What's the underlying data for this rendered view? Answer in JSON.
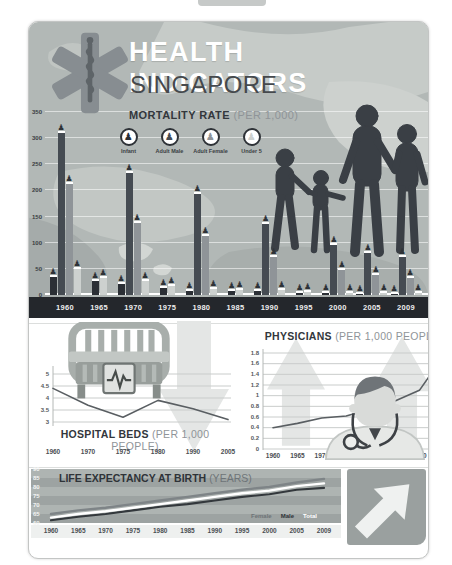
{
  "header": {
    "title": "HEALTH INDICATORS",
    "subtitle": "SINGAPORE"
  },
  "icons": {
    "person": "♟",
    "star_of_life_icon": "six-armed medical star with rod of asclepius",
    "hospital_bed_icon": "hospital bed with ecg panel",
    "doctor_icon": "doctor with stethoscope",
    "family_silhouette": "family of four holding hands",
    "down_arrow_icon": "large down arrow",
    "up_arrow_icon": "large up arrow",
    "up_right_arrow_icon": "large diagonal up-right arrow"
  },
  "colors": {
    "header_bg": "#b2b8b6",
    "card_border": "#c3c5c4",
    "title_text": "#ffffff",
    "subtitle_text": "#45494d",
    "heading_dark": "#33373c",
    "heading_muted": "#8f9498",
    "axis_text": "#3a3e43",
    "year_band_bg": "#24272c",
    "year_band_text": "#ededee",
    "grid_light": "#cdd1cf",
    "line_stroke": "#595e62",
    "arrow_gray": "#e4e6e5",
    "silhouette": "#3a3f45",
    "stripe_light": "#aeb4b2",
    "stripe_dark": "#9da3a2",
    "label_strip_bg": "#eef0ef",
    "bottom_box_bg": "#9aa09f",
    "bottom_arrow": "#eff1f0",
    "bar_infant": "#2b2f35",
    "bar_adult_male": "#454b52",
    "bar_adult_female": "#8f9498",
    "bar_under5": "#cdd1cf"
  },
  "chart_data": [
    {
      "id": "mortality",
      "type": "bar",
      "title": "MORTALITY RATE",
      "title_suffix": "(PER 1,000)",
      "legend": [
        "Infant",
        "Adult Male",
        "Adult Female",
        "Under 5"
      ],
      "categories": [
        "1960",
        "1965",
        "1970",
        "1975",
        "1980",
        "1985",
        "1990",
        "1995",
        "2000",
        "2005",
        "2009"
      ],
      "series": [
        {
          "name": "Infant",
          "color": "#2b2f35",
          "values": [
            35,
            26,
            21,
            14,
            8,
            7,
            7,
            4,
            3,
            2,
            2
          ]
        },
        {
          "name": "Adult Male",
          "color": "#454b52",
          "values": [
            310,
            null,
            233,
            null,
            193,
            null,
            135,
            null,
            95,
            80,
            73
          ]
        },
        {
          "name": "Adult Female",
          "color": "#8f9498",
          "values": [
            213,
            null,
            138,
            null,
            113,
            null,
            72,
            null,
            48,
            38,
            33
          ]
        },
        {
          "name": "Under 5",
          "color": "#cdd1cf",
          "values": [
            50,
            33,
            27,
            17,
            11,
            9,
            9,
            5,
            4,
            3,
            3
          ]
        }
      ],
      "ylim": [
        0,
        350
      ],
      "yticks": [
        "350",
        "300",
        "250",
        "200",
        "150",
        "100",
        "50",
        "0"
      ],
      "grid": true,
      "legend_position": "top"
    },
    {
      "id": "hospital_beds",
      "type": "line",
      "title": "HOSPITAL BEDS",
      "title_suffix": "(PER 1,000 PEOPLE)",
      "x": [
        "1960",
        "1970",
        "1975",
        "1980",
        "1990",
        "2005"
      ],
      "values": [
        4.4,
        3.7,
        3.2,
        3.9,
        3.55,
        3.1
      ],
      "ylim": [
        3,
        5
      ],
      "yticks": [
        "5",
        "4.5",
        "4",
        "3.5",
        "3"
      ],
      "color": "#595e62",
      "trend": "down"
    },
    {
      "id": "physicians",
      "type": "line",
      "title": "PHYSICIANS",
      "title_suffix": "(PER 1,000 PEOPLE)",
      "x": [
        "1960",
        "1965",
        "1970",
        "1975",
        "1980",
        "1985",
        "1990",
        "2009"
      ],
      "values": [
        0.4,
        0.48,
        0.58,
        0.62,
        0.75,
        0.9,
        1.1,
        1.75
      ],
      "ylim": [
        0,
        1.8
      ],
      "yticks": [
        "1.8",
        "1.6",
        "1.4",
        "1.2",
        "1",
        "0.8",
        "0.6",
        "0.4",
        "0.2",
        "0"
      ],
      "color": "#595e62",
      "trend": "up"
    },
    {
      "id": "life_expectancy",
      "type": "line",
      "title": "LIFE EXPECTANCY AT BIRTH",
      "title_suffix": "(YEARS)",
      "x": [
        "1960",
        "1965",
        "1970",
        "1975",
        "1980",
        "1985",
        "1990",
        "1995",
        "2000",
        "2005",
        "2009"
      ],
      "series": [
        {
          "name": "Female",
          "color": "#7e8487",
          "label_color": "#6d7377",
          "values": [
            65,
            67,
            68.5,
            70.5,
            72.5,
            74.5,
            76.5,
            78.5,
            80,
            82.5,
            84.5
          ]
        },
        {
          "name": "Male",
          "color": "#33383c",
          "label_color": "#2f3338",
          "values": [
            61.5,
            63.5,
            65,
            67,
            69,
            70.5,
            72.5,
            74.5,
            76,
            78.5,
            79.5
          ]
        },
        {
          "name": "Total",
          "color": "#ffffff",
          "label_color": "#ffffff",
          "values": [
            63,
            65,
            66.5,
            68.5,
            70.5,
            72.5,
            74.5,
            76.5,
            78,
            80.5,
            82
          ]
        }
      ],
      "ylim": [
        60,
        90
      ],
      "yticks": [
        "90",
        "85",
        "80",
        "75",
        "70",
        "65",
        "60"
      ],
      "legend": [
        "Female",
        "Male",
        "Total"
      ],
      "legend_position": "bottom-right",
      "trend": "up"
    }
  ]
}
